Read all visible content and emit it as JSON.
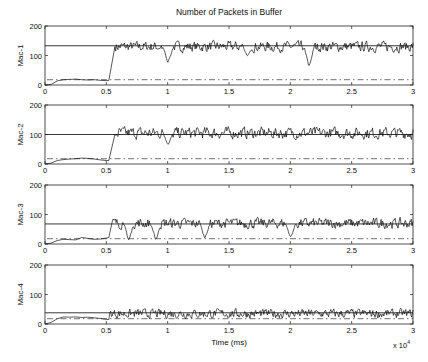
{
  "chart_data": {
    "type": "line",
    "title": "Number of Packets in Buffer",
    "xlabel": "Time (ms)",
    "x_exponent_label": "x 10",
    "x_exponent_power": "4",
    "xlim": [
      0,
      3
    ],
    "x_ticks": [
      "0",
      "0.5",
      "1",
      "1.5",
      "2",
      "2.5",
      "3"
    ],
    "x_tick_values": [
      0,
      0.5,
      1,
      1.5,
      2,
      2.5,
      3
    ],
    "y_ticks": [
      "0",
      "100",
      "200"
    ],
    "y_tick_values": [
      0,
      100,
      200
    ],
    "ylim": [
      0,
      200
    ],
    "grid": false,
    "subplots": [
      {
        "ylabel": "Mac-1",
        "solid_reference": 133,
        "dashdot_reference": 18,
        "segments": [
          {
            "x": [
              0,
              0.05,
              0.1,
              0.15,
              0.2,
              0.25,
              0.3,
              0.35,
              0.4,
              0.45,
              0.5,
              0.52
            ],
            "y": [
              0,
              2,
              14,
              18,
              19,
              20,
              18,
              17,
              18,
              16,
              15,
              15
            ]
          },
          {
            "x": [
              0.52,
              0.57
            ],
            "y": [
              15,
              130
            ]
          }
        ],
        "steady_mean": 130,
        "steady_amplitude": 25,
        "dips": [
          {
            "x": 1.0,
            "y": 72
          },
          {
            "x": 1.65,
            "y": 95
          },
          {
            "x": 2.15,
            "y": 55
          }
        ]
      },
      {
        "ylabel": "Mac-2",
        "solid_reference": 100,
        "dashdot_reference": 18,
        "segments": [
          {
            "x": [
              0,
              0.05,
              0.1,
              0.15,
              0.2,
              0.25,
              0.3,
              0.35,
              0.4,
              0.45,
              0.5,
              0.52
            ],
            "y": [
              0,
              3,
              12,
              15,
              17,
              18,
              20,
              19,
              17,
              14,
              12,
              12
            ]
          },
          {
            "x": [
              0.52,
              0.57
            ],
            "y": [
              12,
              100
            ]
          }
        ],
        "steady_mean": 105,
        "steady_amplitude": 28,
        "dips": [
          {
            "x": 1.0,
            "y": 65
          }
        ]
      },
      {
        "ylabel": "Mac-3",
        "solid_reference": 68,
        "dashdot_reference": 18,
        "segments": [
          {
            "x": [
              0,
              0.05,
              0.1,
              0.15,
              0.2,
              0.25,
              0.3,
              0.35,
              0.4,
              0.45,
              0.5,
              0.52
            ],
            "y": [
              0,
              3,
              12,
              16,
              15,
              14,
              22,
              19,
              16,
              17,
              20,
              22
            ]
          },
          {
            "x": [
              0.52,
              0.55
            ],
            "y": [
              22,
              80
            ]
          }
        ],
        "steady_mean": 70,
        "steady_amplitude": 25,
        "dips": [
          {
            "x": 0.68,
            "y": 8
          },
          {
            "x": 0.9,
            "y": 10
          },
          {
            "x": 1.3,
            "y": 15
          },
          {
            "x": 2.0,
            "y": 20
          }
        ]
      },
      {
        "ylabel": "Mac-4",
        "solid_reference": 38,
        "dashdot_reference": 18,
        "segments": [
          {
            "x": [
              0,
              0.05,
              0.1,
              0.15,
              0.2,
              0.25,
              0.3,
              0.35,
              0.4,
              0.45,
              0.5,
              0.52
            ],
            "y": [
              0,
              5,
              18,
              24,
              23,
              24,
              22,
              23,
              21,
              19,
              16,
              15
            ]
          },
          {
            "x": [
              0.52,
              0.53
            ],
            "y": [
              15,
              40
            ]
          }
        ],
        "steady_mean": 35,
        "steady_amplitude": 22,
        "dips": []
      }
    ]
  }
}
